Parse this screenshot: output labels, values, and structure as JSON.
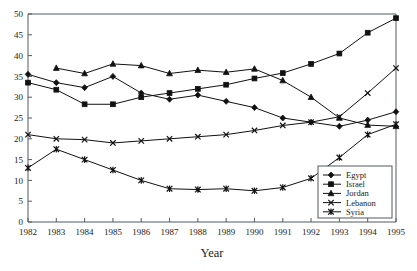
{
  "chart_data": {
    "type": "line",
    "title": "",
    "subtitle": "",
    "xlabel": "Year",
    "ylabel": "",
    "x": [
      1982,
      1983,
      1984,
      1985,
      1986,
      1987,
      1988,
      1989,
      1990,
      1991,
      1992,
      1993,
      1994,
      1995
    ],
    "xlim": [
      1982,
      1995
    ],
    "ylim": [
      0,
      50
    ],
    "ytick_step": 5,
    "yticks": [
      0,
      5,
      10,
      15,
      20,
      25,
      30,
      35,
      40,
      45,
      50
    ],
    "xticks": [
      "1982",
      "1983",
      "1984",
      "1985",
      "1986",
      "1987",
      "1988",
      "1989",
      "1990",
      "1991",
      "1992",
      "1993",
      "1994",
      "1995"
    ],
    "ytick_labels": [
      "0",
      "5",
      "10",
      "15",
      "20",
      "25",
      "30",
      "35",
      "40",
      "45",
      "50"
    ],
    "grid": false,
    "legend_position": "bottom-right",
    "series": [
      {
        "name": "Egypt",
        "marker": "diamond",
        "values": [
          35.5,
          33.5,
          32.3,
          35.0,
          31.0,
          29.5,
          30.5,
          29.0,
          27.5,
          25.0,
          24.0,
          23.0,
          24.5,
          26.5
        ]
      },
      {
        "name": "Israel",
        "marker": "square",
        "values": [
          33.5,
          31.8,
          28.3,
          28.3,
          30.0,
          31.0,
          32.0,
          33.0,
          34.5,
          35.8,
          38.0,
          40.5,
          45.5,
          49.0
        ]
      },
      {
        "name": "Jordan",
        "marker": "triangle",
        "values": [
          null,
          37.0,
          35.7,
          38.0,
          37.6,
          35.7,
          36.5,
          36.0,
          36.8,
          34.0,
          30.0,
          25.0,
          23.3,
          23.0
        ]
      },
      {
        "name": "Lebanon",
        "marker": "x",
        "values": [
          21.0,
          20.0,
          19.8,
          19.0,
          19.5,
          20.0,
          20.5,
          21.0,
          22.0,
          23.2,
          24.0,
          25.3,
          31.0,
          37.0
        ]
      },
      {
        "name": "Syria",
        "marker": "star",
        "values": [
          13.0,
          17.5,
          15.0,
          12.5,
          10.0,
          8.0,
          7.8,
          8.0,
          7.5,
          8.3,
          10.5,
          15.5,
          21.0,
          23.5
        ]
      }
    ],
    "legend_entries": [
      "Egypt",
      "Israel",
      "Jordan",
      "Lebanon",
      "Syria"
    ],
    "colors": {
      "line": "#111111",
      "axis": "#555b5e",
      "background": "#ffffff"
    }
  }
}
